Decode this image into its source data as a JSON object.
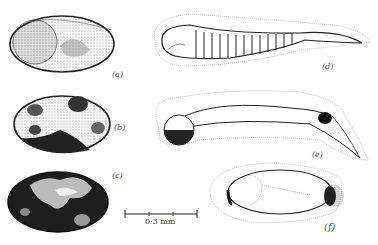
{
  "figure": {
    "panels": [
      {
        "id": "a",
        "label": "(a)",
        "description": "egg, lightly stippled"
      },
      {
        "id": "b",
        "label": "(b)",
        "description": "egg, blotched"
      },
      {
        "id": "c",
        "label": "(c)",
        "description": "egg, heavily pigmented"
      },
      {
        "id": "d",
        "label": "(d)",
        "description": "segmented embryo with envelope"
      },
      {
        "id": "e",
        "label": "(e)",
        "description": "embryo with dark head and tail spot"
      },
      {
        "id": "f",
        "label": "(f)",
        "description": "egg with envelope and dark pole"
      }
    ],
    "scale_bar": {
      "label": "0·3 mm"
    }
  },
  "colors": {
    "ink": "#222222",
    "stipple": "#555555",
    "background": "#ffffff"
  }
}
